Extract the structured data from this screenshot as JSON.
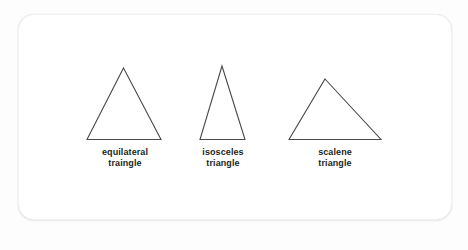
{
  "figure": {
    "background_color": "#fdfdfd",
    "card_color": "#ffffff",
    "stroke_color": "#4a4a4a",
    "text_color": "#231f20",
    "shapes": [
      {
        "id": "equilateral",
        "shape_name": "equilateral-triangle",
        "label_line1": "equilateral",
        "label_line2": "traingle",
        "points": "123.5,68 161,139.5 87,139.5",
        "apex": {
          "x": 123.5,
          "y": 68
        },
        "base_left": {
          "x": 87,
          "y": 139.5
        },
        "base_right": {
          "x": 161,
          "y": 139.5
        }
      },
      {
        "id": "isosceles",
        "shape_name": "isosceles-triangle",
        "label_line1": "isosceles",
        "label_line2": "triangle",
        "points": "222,66 245,139.5 200,139.5",
        "apex": {
          "x": 222,
          "y": 66
        },
        "base_left": {
          "x": 200,
          "y": 139.5
        },
        "base_right": {
          "x": 245,
          "y": 139.5
        }
      },
      {
        "id": "scalene",
        "shape_name": "scalene-triangle",
        "label_line1": "scalene",
        "label_line2": "triangle",
        "points": "325,79 381,139.5 289,139.5",
        "apex": {
          "x": 325,
          "y": 79
        },
        "base_left": {
          "x": 289,
          "y": 139.5
        },
        "base_right": {
          "x": 381,
          "y": 139.5
        }
      }
    ]
  }
}
